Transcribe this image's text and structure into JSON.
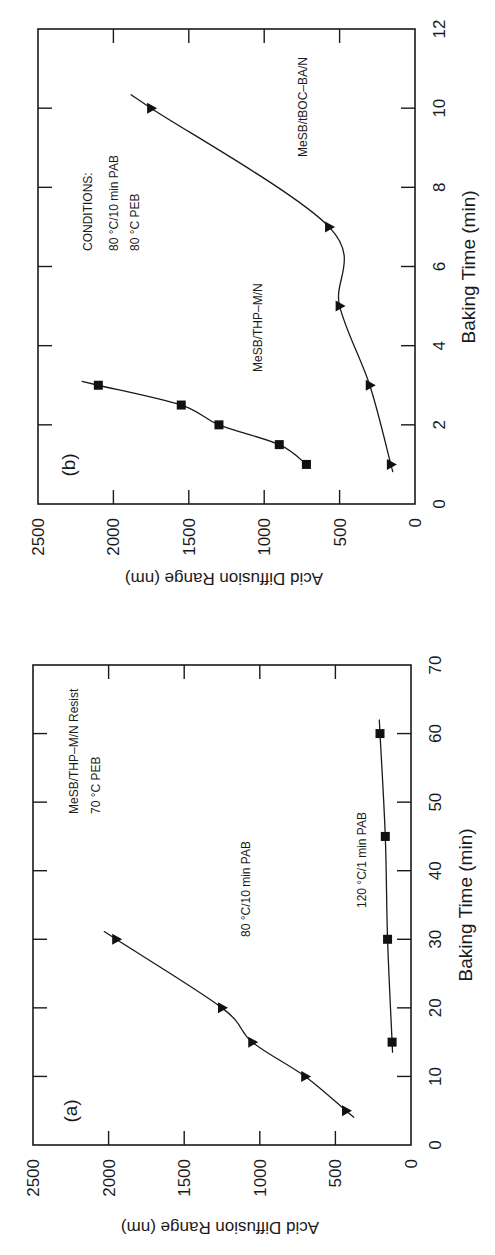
{
  "figure": {
    "orientation_note": "Figure rotated 90 degrees clockwise; Baking Time runs bottom-to-top, Acid Diffusion Range runs right-to-left",
    "panels": [
      {
        "id": "b",
        "panel_label": "(b)",
        "xlabel": "Baking Time (min)",
        "ylabel": "Acid Diffusion Range (nm)",
        "x_ticks": [
          "0",
          "2",
          "4",
          "6",
          "8",
          "10",
          "12"
        ],
        "y_ticks": [
          "0",
          "500",
          "1000",
          "1500",
          "2000",
          "2500"
        ],
        "annotations": {
          "conditions_title": "CONDITIONS:",
          "conditions_line1": "80 °C/10 min PAB",
          "conditions_line2": "80 °C PEB",
          "series1_label": "MeSB/THP–M/N",
          "series2_label": "MeSB/tBOC–BA/N"
        }
      },
      {
        "id": "a",
        "panel_label": "(a)",
        "xlabel": "Baking Time (min)",
        "ylabel": "Acid Diffusion Range (nm)",
        "x_ticks": [
          "0",
          "10",
          "20",
          "30",
          "40",
          "50",
          "60",
          "70"
        ],
        "y_ticks": [
          "0",
          "500",
          "1000",
          "1500",
          "2000",
          "2500"
        ],
        "annotations": {
          "resist_line1": "MeSB/THP–M/N Resist",
          "resist_line2": "70 °C PEB",
          "series1_label": "80 °C/10 min PAB",
          "series2_label": "120 °C/1 min PAB"
        }
      }
    ]
  },
  "chart_data": [
    {
      "type": "line",
      "panel": "(a)",
      "title": "MeSB/THP–M/N Resist, 70 °C PEB",
      "xlabel": "Baking Time (min)",
      "ylabel": "Acid Diffusion Range (nm)",
      "xlim": [
        0,
        70
      ],
      "ylim": [
        0,
        2500
      ],
      "x_ticks": [
        0,
        10,
        20,
        30,
        40,
        50,
        60,
        70
      ],
      "y_ticks": [
        0,
        500,
        1000,
        1500,
        2000,
        2500
      ],
      "grid": false,
      "legend": "inline text labels",
      "series": [
        {
          "name": "80 °C/10 min PAB",
          "marker": "triangle",
          "x": [
            5,
            10,
            15,
            20,
            30
          ],
          "y": [
            430,
            700,
            1050,
            1250,
            1950
          ],
          "fit_range": [
            4,
            31
          ]
        },
        {
          "name": "120 °C/1 min PAB",
          "marker": "square",
          "x": [
            15,
            30,
            45,
            60
          ],
          "y": [
            125,
            155,
            170,
            205
          ],
          "fit_range": [
            14,
            62
          ]
        }
      ]
    },
    {
      "type": "line",
      "panel": "(b)",
      "title": "CONDITIONS: 80 °C/10 min PAB, 80 °C PEB",
      "xlabel": "Baking Time (min)",
      "ylabel": "Acid Diffusion Range (nm)",
      "xlim": [
        0,
        12
      ],
      "ylim": [
        0,
        2500
      ],
      "x_ticks": [
        0,
        2,
        4,
        6,
        8,
        10,
        12
      ],
      "y_ticks": [
        0,
        500,
        1000,
        1500,
        2000,
        2500
      ],
      "grid": false,
      "legend": "inline text labels",
      "series": [
        {
          "name": "MeSB/THP–M/N",
          "marker": "square",
          "x": [
            1,
            1.5,
            2,
            2.5,
            3
          ],
          "y": [
            720,
            900,
            1300,
            1550,
            2100
          ],
          "fit_range": [
            1,
            3.1
          ]
        },
        {
          "name": "MeSB/tBOC–BA/N",
          "marker": "triangle",
          "x": [
            1,
            3,
            5,
            7,
            10
          ],
          "y": [
            160,
            300,
            500,
            570,
            1750
          ],
          "fit_range": [
            0.9,
            10.3
          ]
        }
      ]
    }
  ]
}
